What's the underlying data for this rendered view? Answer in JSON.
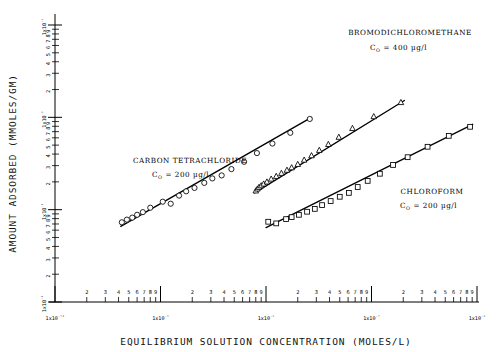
{
  "chart_data": {
    "type": "scatter",
    "title": "",
    "xlabel": "EQUILIBRIUM SOLUTION CONCENTRATION (MOLES/L)",
    "ylabel": "AMOUNT ADSORBED (MMOLES/GM)",
    "xscale": "log",
    "yscale": "log",
    "xlim": [
      1e-10,
      1e-06
    ],
    "ylim": [
      0.0001,
      0.1
    ],
    "grid": false,
    "legend_position": "inline-annotations",
    "x_decade_labels": [
      "1x10⁻¹⁰",
      "1x10⁻⁹",
      "1x10⁻⁸",
      "1x10⁻⁷",
      "1x10⁻⁶"
    ],
    "y_decade_labels": [
      "1x10⁻⁴",
      "1x10⁻³",
      "1x10⁻²",
      "1x10⁻¹"
    ],
    "minor_tick_numbers": [
      "2",
      "3",
      "4",
      "5",
      "6",
      "7",
      "8",
      "9"
    ],
    "series": [
      {
        "name": "CARBON TETRACHLORIDE",
        "concentration_label": "C₀ = 200 µg/l",
        "marker": "circle",
        "points": [
          [
            4.3e-10,
            0.00073
          ],
          [
            4.8e-10,
            0.00078
          ],
          [
            5.4e-10,
            0.00082
          ],
          [
            6e-10,
            0.00088
          ],
          [
            6.8e-10,
            0.00094
          ],
          [
            8e-10,
            0.00105
          ],
          [
            1.05e-09,
            0.00122
          ],
          [
            1.25e-09,
            0.00116
          ],
          [
            1.5e-09,
            0.00142
          ],
          [
            1.75e-09,
            0.00158
          ],
          [
            2.1e-09,
            0.00172
          ],
          [
            2.6e-09,
            0.00195
          ],
          [
            3.1e-09,
            0.00218
          ],
          [
            3.8e-09,
            0.00235
          ],
          [
            4.7e-09,
            0.00275
          ],
          [
            6.2e-09,
            0.0033
          ],
          [
            8.2e-09,
            0.0041
          ],
          [
            1.15e-08,
            0.0052
          ],
          [
            1.7e-08,
            0.0068
          ],
          [
            2.6e-08,
            0.0096
          ]
        ]
      },
      {
        "name": "BROMODICHLOROMETHANE",
        "concentration_label": "C₀ = 400 µg/l",
        "marker": "triangle",
        "points": [
          [
            8e-09,
            0.0016
          ],
          [
            8.3e-09,
            0.00168
          ],
          [
            8.6e-09,
            0.00175
          ],
          [
            9e-09,
            0.00182
          ],
          [
            9.5e-09,
            0.0019
          ],
          [
            1.02e-08,
            0.002
          ],
          [
            1.12e-08,
            0.00215
          ],
          [
            1.25e-08,
            0.0023
          ],
          [
            1.4e-08,
            0.00248
          ],
          [
            1.58e-08,
            0.00268
          ],
          [
            1.75e-08,
            0.00285
          ],
          [
            2e-08,
            0.0031
          ],
          [
            2.3e-08,
            0.00345
          ],
          [
            2.7e-08,
            0.00385
          ],
          [
            3.2e-08,
            0.0044
          ],
          [
            3.9e-08,
            0.0051
          ],
          [
            4.9e-08,
            0.0061
          ],
          [
            6.6e-08,
            0.0076
          ],
          [
            1.05e-07,
            0.0102
          ],
          [
            1.9e-07,
            0.0145
          ]
        ]
      },
      {
        "name": "CHLOROFORM",
        "concentration_label": "C₀ = 200 µg/l",
        "marker": "square",
        "points": [
          [
            1.05e-08,
            0.00074
          ],
          [
            1.25e-08,
            0.00071
          ],
          [
            1.55e-08,
            0.00079
          ],
          [
            1.75e-08,
            0.00083
          ],
          [
            2.05e-08,
            0.00088
          ],
          [
            2.45e-08,
            0.00095
          ],
          [
            2.9e-08,
            0.00102
          ],
          [
            3.4e-08,
            0.00112
          ],
          [
            4.1e-08,
            0.00124
          ],
          [
            5e-08,
            0.00138
          ],
          [
            6.1e-08,
            0.00152
          ],
          [
            7.4e-08,
            0.00176
          ],
          [
            9.2e-08,
            0.00205
          ],
          [
            1.2e-07,
            0.00245
          ],
          [
            1.6e-07,
            0.00305
          ],
          [
            2.2e-07,
            0.0037
          ],
          [
            3.4e-07,
            0.0048
          ],
          [
            5.4e-07,
            0.0063
          ],
          [
            8.6e-07,
            0.0079
          ]
        ]
      }
    ],
    "fit_lines": [
      {
        "name": "CARBON TETRACHLORIDE",
        "x1": 4.2e-10,
        "y1": 0.00066,
        "x2": 2.7e-08,
        "y2": 0.01
      },
      {
        "name": "BROMODICHLOROMETHANE",
        "x1": 7.8e-09,
        "y1": 0.00152,
        "x2": 2.05e-07,
        "y2": 0.0152
      },
      {
        "name": "CHLOROFORM",
        "x1": 1e-08,
        "y1": 0.00064,
        "x2": 9.1e-07,
        "y2": 0.0084
      }
    ]
  },
  "annotations": [
    {
      "id": "bromodichloromethane",
      "title": "BROMODICHLOROMETHANE",
      "sub": "= 400 µg/l"
    },
    {
      "id": "carbon-tetrachloride",
      "title": "CARBON TETRACHLORIDE",
      "sub": "= 200 µg/l"
    },
    {
      "id": "chloroform",
      "title": "CHLOROFORM",
      "sub": "= 200 µg/l"
    }
  ]
}
